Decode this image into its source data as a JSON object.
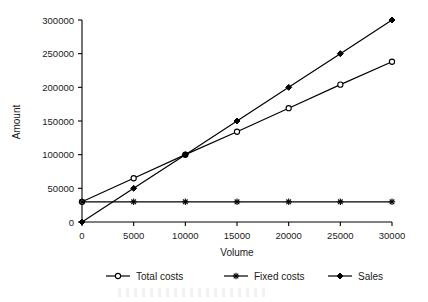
{
  "chart_data": {
    "type": "line",
    "title": "",
    "xlabel": "Volume",
    "ylabel": "Amount",
    "x": [
      0,
      5000,
      10000,
      15000,
      20000,
      25000,
      30000
    ],
    "categories": [
      "0",
      "5000",
      "10000",
      "15000",
      "20000",
      "25000",
      "30000"
    ],
    "xlim": [
      0,
      30000
    ],
    "ylim": [
      0,
      300000
    ],
    "xticks": [
      0,
      5000,
      10000,
      15000,
      20000,
      25000,
      30000
    ],
    "yticks": [
      0,
      50000,
      100000,
      150000,
      200000,
      250000,
      300000
    ],
    "xtick_labels": [
      "0",
      "5000",
      "10000",
      "15000",
      "20000",
      "25000",
      "30000"
    ],
    "ytick_labels": [
      "0",
      "50000",
      "100000",
      "150000",
      "200000",
      "250000",
      "300000"
    ],
    "grid": false,
    "legend_position": "bottom",
    "series": [
      {
        "name": "Total costs",
        "marker": "open-circle",
        "color": "#000000",
        "values": [
          30000,
          65000,
          100000,
          134000,
          169000,
          204000,
          238000
        ]
      },
      {
        "name": "Fixed costs",
        "marker": "star",
        "color": "#000000",
        "values": [
          30000,
          30000,
          30000,
          30000,
          30000,
          30000,
          30000
        ]
      },
      {
        "name": "Sales",
        "marker": "filled-diamond",
        "color": "#000000",
        "values": [
          0,
          50000,
          100000,
          150000,
          200000,
          250000,
          300000
        ]
      }
    ]
  },
  "legend": {
    "items": [
      {
        "label": "Total costs"
      },
      {
        "label": "Fixed costs"
      },
      {
        "label": "Sales"
      }
    ]
  },
  "axes": {
    "x_title": "Volume",
    "y_title": "Amount"
  }
}
